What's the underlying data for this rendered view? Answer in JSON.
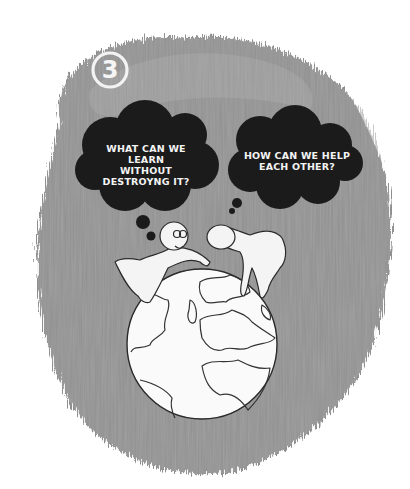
{
  "illustration": {
    "step_number": "3",
    "thought_bubbles": [
      {
        "speaker": "small-figure-left",
        "lines": [
          "WHAT CAN WE LEARN",
          "WITHOUT",
          "DESTROYNG IT?"
        ]
      },
      {
        "speaker": "tall-figure-right",
        "lines": [
          "HOW CAN WE HELP",
          "EACH OTHER?"
        ]
      }
    ],
    "colors": {
      "background": "#ffffff",
      "wash": "#8e8e8e",
      "wash_light": "#a9a9a9",
      "cloud": "#1c1c1c",
      "figure_fill": "#f4f4f4",
      "outline": "#2a2a2a"
    }
  }
}
